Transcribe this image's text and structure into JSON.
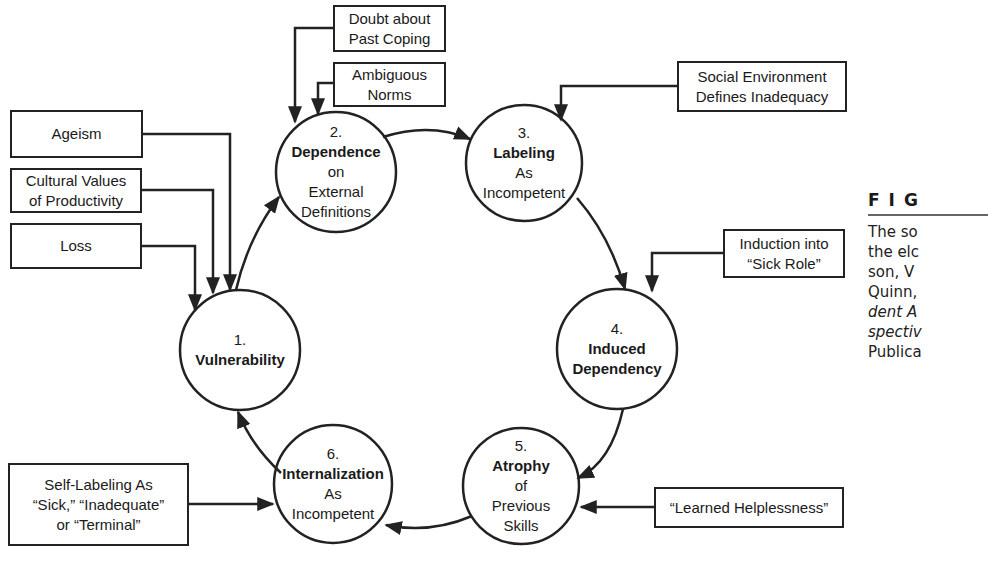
{
  "nodes": [
    {
      "id": "1",
      "number": "1.",
      "lines": [
        {
          "text": "Vulnerability",
          "bold": true
        }
      ]
    },
    {
      "id": "2",
      "number": "2.",
      "lines": [
        {
          "text": "Dependence",
          "bold": true
        },
        {
          "text": "on",
          "bold": false
        },
        {
          "text": "External",
          "bold": false
        },
        {
          "text": "Definitions",
          "bold": false
        }
      ]
    },
    {
      "id": "3",
      "number": "3.",
      "lines": [
        {
          "text": "Labeling",
          "bold": true
        },
        {
          "text": "As",
          "bold": false
        },
        {
          "text": "Incompetent",
          "bold": false
        }
      ]
    },
    {
      "id": "4",
      "number": "4.",
      "lines": [
        {
          "text": "Induced",
          "bold": true
        },
        {
          "text": "Dependency",
          "bold": true
        }
      ]
    },
    {
      "id": "5",
      "number": "5.",
      "lines": [
        {
          "text": "Atrophy",
          "bold": true
        },
        {
          "text": "of",
          "bold": false
        },
        {
          "text": "Previous",
          "bold": false
        },
        {
          "text": "Skills",
          "bold": false
        }
      ]
    },
    {
      "id": "6",
      "number": "6.",
      "lines": [
        {
          "text": "Internalization",
          "bold": true
        },
        {
          "text": "As",
          "bold": false
        },
        {
          "text": "Incompetent",
          "bold": false
        }
      ]
    }
  ],
  "factors": {
    "doubt_about_past_coping": "Doubt about\nPast Coping",
    "ambiguous_norms": "Ambiguous\nNorms",
    "ageism": "Ageism",
    "cultural_values": "Cultural Values\nof Productivity",
    "loss": "Loss",
    "social_environment": "Social Environment\nDefines Inadequacy",
    "induction_sick_role": "Induction into\n“Sick Role”",
    "self_labeling": "Self-Labeling As\n“Sick,” “Inadequate”\nor “Terminal”",
    "learned_helplessness": "“Learned Helplessness”"
  },
  "caption": {
    "heading": "FIG",
    "lines": [
      {
        "text": "The so",
        "italic": false
      },
      {
        "text": "the elc",
        "italic": false
      },
      {
        "text": "son, V",
        "italic": false
      },
      {
        "text": "Quinn,",
        "italic": false
      },
      {
        "text": "dent A",
        "italic": true
      },
      {
        "text": "spectiv",
        "italic": true
      },
      {
        "text": "Publica",
        "italic": false
      }
    ]
  },
  "colors": {
    "stroke": "#222222",
    "background": "#ffffff"
  }
}
